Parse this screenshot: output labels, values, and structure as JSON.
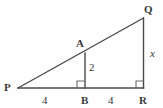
{
  "figure": {
    "type": "geometry-diagram",
    "stroke_color": "#4a4a4a",
    "background_color": "#fefefe",
    "text_color": "#3a3a3a",
    "vertices": [
      {
        "id": "P",
        "label": "P",
        "x": 18,
        "y": 88
      },
      {
        "id": "B",
        "label": "B",
        "x": 85,
        "y": 88
      },
      {
        "id": "R",
        "label": "R",
        "x": 143,
        "y": 88
      },
      {
        "id": "Q",
        "label": "Q",
        "x": 143,
        "y": 18
      },
      {
        "id": "A",
        "label": "A",
        "x": 85,
        "y": 53
      }
    ],
    "segments": [
      {
        "id": "PR",
        "from": "P",
        "to": "R",
        "kind": "base"
      },
      {
        "id": "PQ",
        "from": "P",
        "to": "Q",
        "kind": "hypotenuse"
      },
      {
        "id": "QR",
        "from": "Q",
        "to": "R",
        "kind": "leg"
      },
      {
        "id": "AB",
        "from": "A",
        "to": "B",
        "kind": "altitude"
      }
    ],
    "measures": [
      {
        "id": "PB",
        "label": "4",
        "style": "upright",
        "segment": "P to B"
      },
      {
        "id": "BR",
        "label": "4",
        "style": "upright",
        "segment": "B to R"
      },
      {
        "id": "AB",
        "label": "2",
        "style": "upright",
        "segment": "A to B"
      },
      {
        "id": "QR",
        "label": "x",
        "style": "italic",
        "segment": "Q to R"
      }
    ],
    "right_angles": [
      {
        "id": "angle-at-B",
        "at": "B",
        "x": 77,
        "y": 81,
        "size": 7
      },
      {
        "id": "angle-at-R",
        "at": "R",
        "x": 136,
        "y": 81,
        "size": 7
      }
    ]
  }
}
